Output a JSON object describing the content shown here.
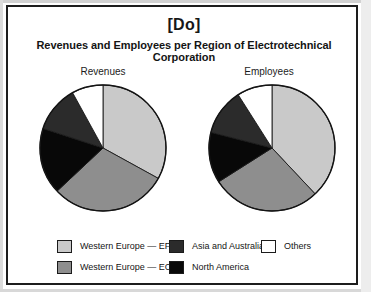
{
  "header": {
    "do_tag": "[Do]",
    "title": "Revenues and Employees per Region of Electrotechnical Corporation"
  },
  "charts": {
    "left_caption": "Revenues",
    "right_caption": "Employees"
  },
  "legend": {
    "items": [
      {
        "label": "Western Europe — EFTA",
        "color": "#c9c9c9",
        "swatch": "light-gray-swatch"
      },
      {
        "label": "Western Europe — EC",
        "color": "#8e8e8e",
        "swatch": "medium-gray-swatch"
      },
      {
        "label": "Asia and Australia",
        "color": "#2b2b2b",
        "swatch": "dark-gray-swatch"
      },
      {
        "label": "North America",
        "color": "#080808",
        "swatch": "black-swatch"
      },
      {
        "label": "Others",
        "color": "#ffffff",
        "swatch": "white-swatch"
      }
    ]
  },
  "chart_data": {
    "type": "pie",
    "title": "Revenues and Employees per Region of Electrotechnical Corporation",
    "legend_position": "bottom",
    "categories": [
      "Western Europe — EFTA",
      "Western Europe — EC",
      "North America",
      "Asia and Australia",
      "Others"
    ],
    "colors": [
      "#c9c9c9",
      "#8e8e8e",
      "#080808",
      "#2b2b2b",
      "#ffffff"
    ],
    "start_angle": 0,
    "direction": "clockwise",
    "units": "percent",
    "series": [
      {
        "name": "Revenues",
        "values": [
          33,
          30,
          17,
          12,
          8
        ]
      },
      {
        "name": "Employees",
        "values": [
          38,
          28,
          13,
          12,
          9
        ]
      }
    ]
  }
}
